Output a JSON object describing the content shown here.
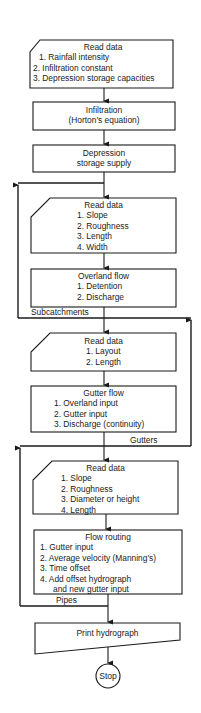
{
  "diagram": {
    "type": "flowchart",
    "stroke_color": "#1a1a1a",
    "background": "#ffffff"
  },
  "nodes": {
    "read_data_1": {
      "shape": "card",
      "title": "Read data",
      "items": [
        "1.  Rainfall intensity",
        "2.  Infiltration constant",
        "3.  Depression storage capacities"
      ]
    },
    "infiltration": {
      "shape": "process",
      "title": "Infiltration",
      "subtitle": "(Horton’s equation)"
    },
    "depression": {
      "shape": "process",
      "title": "Depression",
      "subtitle": "storage supply"
    },
    "read_data_2": {
      "shape": "card",
      "title": "Read data",
      "items": [
        "1.  Slope",
        "2.  Roughness",
        "3.  Length",
        "4.  Width"
      ]
    },
    "overland_flow": {
      "shape": "process",
      "title": "Overland flow",
      "items": [
        "1.  Detention",
        "2.  Discharge"
      ]
    },
    "read_data_3": {
      "shape": "card",
      "title": "Read data",
      "items": [
        "1.  Layout",
        "2.  Length"
      ]
    },
    "gutter_flow": {
      "shape": "process",
      "title": "Gutter flow",
      "items": [
        "1.  Overland input",
        "2.  Gutter input",
        "3.  Discharge (continuity)"
      ]
    },
    "read_data_4": {
      "shape": "card",
      "title": "Read data",
      "items": [
        "1.  Slope",
        "2.  Roughness",
        "3.  Diameter or height",
        "4.  Length"
      ]
    },
    "flow_routing": {
      "shape": "process",
      "title": "Flow routing",
      "items": [
        "1.  Gutter input",
        "2.  Average velocity (Manning’s)",
        "3.  Time offset",
        "4.  Add offset hydrograph",
        "     and new gutter input"
      ]
    },
    "print": {
      "shape": "document",
      "title": "Print hydrograph"
    },
    "stop": {
      "shape": "terminal",
      "title": "Stop"
    }
  },
  "loop_labels": {
    "subcatchments": "Subcatchments",
    "gutters": "Gutters",
    "pipes": "Pipes"
  }
}
